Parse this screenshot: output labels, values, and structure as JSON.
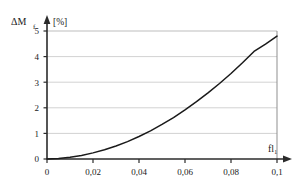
{
  "chart_data": {
    "type": "line",
    "title": "",
    "xlabel": "fl₁",
    "ylabel": "ΔM",
    "ylabel_sub": "f",
    "yunit": "[%]",
    "xlim": [
      0,
      0.1
    ],
    "ylim": [
      0,
      5
    ],
    "grid": true,
    "legend": null,
    "x_ticks": [
      "0",
      "0,02",
      "0,04",
      "0,06",
      "0,08",
      "0,1"
    ],
    "x_tick_values": [
      0,
      0.02,
      0.04,
      0.06,
      0.08,
      0.1
    ],
    "y_ticks": [
      "0",
      "1",
      "2",
      "3",
      "4",
      "5"
    ],
    "y_tick_values": [
      0,
      1,
      2,
      3,
      4,
      5
    ],
    "series": [
      {
        "name": "ΔM_f",
        "x": [
          0,
          0.005,
          0.01,
          0.015,
          0.02,
          0.025,
          0.03,
          0.035,
          0.04,
          0.045,
          0.05,
          0.055,
          0.06,
          0.065,
          0.07,
          0.075,
          0.08,
          0.085,
          0.09,
          0.095,
          0.1
        ],
        "values": [
          0.0,
          0.02,
          0.07,
          0.14,
          0.24,
          0.36,
          0.51,
          0.68,
          0.88,
          1.1,
          1.35,
          1.62,
          1.92,
          2.24,
          2.58,
          2.95,
          3.34,
          3.76,
          4.2,
          4.49,
          4.8
        ]
      }
    ]
  },
  "axis_colors": {
    "axis": "#2b2b2b",
    "grid": "#c8c8c8",
    "curve": "#1a1a1a",
    "frame": "#9a9a9a"
  }
}
